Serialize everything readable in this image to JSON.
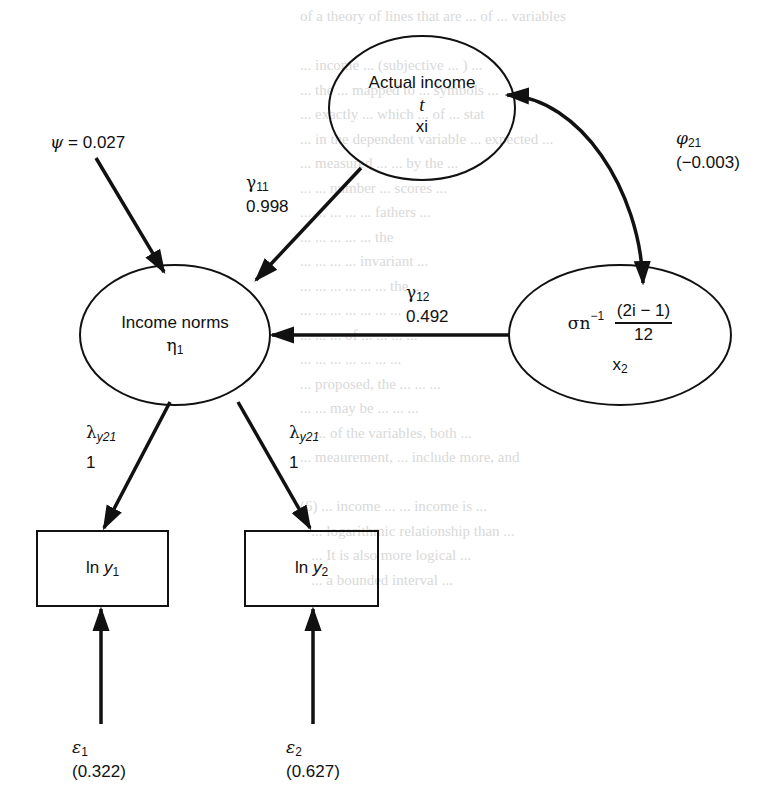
{
  "diagram": {
    "type": "path-diagram",
    "nodes": {
      "actual_income": {
        "title": "Actual income",
        "symbol": "t",
        "var": "xi"
      },
      "income_norms": {
        "title": "Income norms",
        "symbol": "η",
        "symbol_sub": "1"
      },
      "x2": {
        "sigma": "σn",
        "exp": "−1",
        "frac_num": "(2i − 1)",
        "frac_den": "12",
        "var": "x",
        "var_sub": "2"
      },
      "ln_y1": {
        "prefix": "ln ",
        "var": "y",
        "sub": "1"
      },
      "ln_y2": {
        "prefix": "ln ",
        "var": "y",
        "sub": "2"
      }
    },
    "edges": {
      "psi": {
        "symbol": "ψ",
        "value": "= 0.027"
      },
      "gamma11": {
        "symbol": "γ",
        "sub": "11",
        "value": "0.998"
      },
      "gamma12": {
        "symbol": "γ",
        "sub": "12",
        "value": "0.492"
      },
      "phi21": {
        "symbol": "φ",
        "sub": "21",
        "value": "(−0.003)"
      },
      "lambda1": {
        "symbol": "λ",
        "sub": "y21",
        "value": "1"
      },
      "lambda2": {
        "symbol": "λ",
        "sub": "y21",
        "value": "1"
      },
      "eps1": {
        "symbol": "ε",
        "sub": "1",
        "value": "(0.322)"
      },
      "eps2": {
        "symbol": "ε",
        "sub": "2",
        "value": "(0.627)"
      }
    }
  },
  "background_text": {
    "lines": [
      "of a theory of lines that are ... of ... variables",
      "",
      "... income ... (subjective ... ) ...",
      "... the ... mapped to ... symbols ... ",
      "... exactly ... which ... of ... stat",
      "... in the dependent variable ... expected ...",
      "... measured ... ... by the ... ",
      "... ... number ... scores ... ",
      "... ... ... ... ... fathers ...",
      "... ... ... ... ... the",
      "... ... ... ... invariant ... ",
      "... ... ... ... ... ... the ...",
      "... ... ... ... ... ... ...",
      "... ... ... of ... ... ... ...",
      "... ... ... ... ... ... ...",
      "... proposed, the ... ... ... ",
      "... ... may be ... ... ... ",
      "... ... of the variables, both ... ",
      "... meaurement, ... include more, and",
      "",
      "(6) ... income ... ... income is ... ",
      "   ... logarithmic relationship than ... ",
      "   ... It is also more logical ... ",
      "   ... a bounded interval ... "
    ]
  }
}
